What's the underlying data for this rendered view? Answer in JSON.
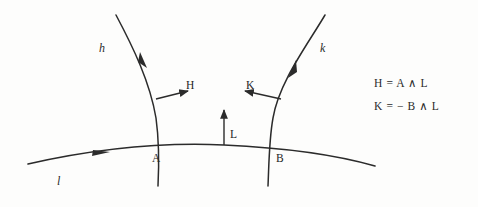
{
  "figure": {
    "curves": [
      {
        "id": "h",
        "label": "h",
        "label_x": 99,
        "label_y": 41
      },
      {
        "id": "k",
        "label": "k",
        "label_x": 320,
        "label_y": 41
      },
      {
        "id": "l",
        "label": "l",
        "label_x": 57,
        "label_y": 174
      }
    ],
    "points": [
      {
        "id": "A",
        "label": "A",
        "label_x": 152,
        "label_y": 152,
        "x": 157,
        "y": 148
      },
      {
        "id": "B",
        "label": "B",
        "label_x": 276,
        "label_y": 152,
        "x": 271,
        "y": 147
      }
    ],
    "vectors": [
      {
        "id": "H",
        "label": "H",
        "label_x": 186,
        "label_y": 79,
        "direction": "right"
      },
      {
        "id": "K",
        "label": "K",
        "label_x": 246,
        "label_y": 79,
        "direction": "left"
      },
      {
        "id": "L",
        "label": "L",
        "label_x": 230,
        "label_y": 128,
        "direction": "up"
      }
    ],
    "equations": [
      "H = A ∧ L",
      "K = − B ∧ L"
    ],
    "colors": {
      "ink": "#2b2b2b",
      "background": "#fdfdfc"
    }
  }
}
